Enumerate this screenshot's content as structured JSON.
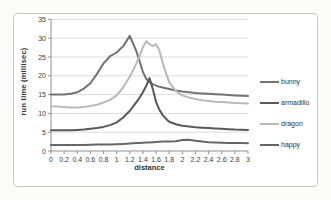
{
  "chart_data": {
    "type": "line",
    "title": "",
    "xlabel": "distance",
    "ylabel": "run time (millisec)",
    "xlim": [
      0,
      3
    ],
    "ylim": [
      0,
      35
    ],
    "grid": "horizontal",
    "legend_position": "right",
    "y_ticks": [
      0,
      5,
      10,
      15,
      20,
      25,
      30,
      35
    ],
    "y_tick_labels": [
      "0",
      "5",
      "10",
      "15",
      "20",
      "25",
      "30",
      "35"
    ],
    "x_ticks": [
      0,
      0.2,
      0.4,
      0.6,
      0.8,
      1,
      1.2,
      1.4,
      1.6,
      1.8,
      2,
      2.2,
      2.4,
      2.6,
      2.8,
      3
    ],
    "x_tick_labels": [
      "0",
      "0.2",
      "0.4",
      "0.6",
      "0.8",
      "1",
      "1.2",
      "1.4",
      "1.6",
      "1.8",
      "2",
      "2.2",
      "2.4",
      "2.6",
      "2.8",
      "3"
    ],
    "x": [
      0,
      0.1,
      0.2,
      0.3,
      0.4,
      0.5,
      0.6,
      0.7,
      0.8,
      0.9,
      1,
      1.1,
      1.2,
      1.3,
      1.35,
      1.4,
      1.45,
      1.5,
      1.55,
      1.6,
      1.65,
      1.7,
      1.75,
      1.8,
      1.9,
      2,
      2.1,
      2.2,
      2.3,
      2.4,
      2.5,
      2.6,
      2.7,
      2.8,
      2.9,
      3
    ],
    "series": [
      {
        "name": "bunny",
        "color": "#737373",
        "values": [
          15,
          15,
          15,
          15.2,
          15.6,
          16.6,
          18,
          20.5,
          23.3,
          25.2,
          26.2,
          27.9,
          30.6,
          26.5,
          23.8,
          21,
          19.2,
          18.3,
          17.8,
          17.4,
          17.1,
          16.9,
          16.7,
          16.5,
          16.1,
          15.8,
          15.6,
          15.4,
          15.3,
          15.2,
          15.1,
          15,
          14.9,
          14.8,
          14.7,
          14.6
        ]
      },
      {
        "name": "armadillo",
        "color": "#595959",
        "values": [
          5.5,
          5.5,
          5.5,
          5.5,
          5.6,
          5.7,
          5.9,
          6.1,
          6.4,
          6.9,
          7.6,
          8.9,
          10.7,
          13,
          14.2,
          15.6,
          17.3,
          19.4,
          16.5,
          13,
          11,
          9.6,
          8.6,
          7.8,
          7.1,
          6.7,
          6.5,
          6.3,
          6.2,
          6.1,
          6,
          5.9,
          5.8,
          5.7,
          5.65,
          5.6
        ]
      },
      {
        "name": "dragon",
        "color": "#b9b9b9",
        "values": [
          11.9,
          11.8,
          11.7,
          11.6,
          11.6,
          11.7,
          12,
          12.3,
          12.9,
          13.6,
          14.8,
          16.9,
          19.8,
          23.3,
          25.4,
          27.6,
          29.2,
          28.4,
          27.9,
          28.4,
          26.8,
          23.5,
          20.8,
          18.3,
          15.9,
          14.8,
          14.2,
          13.8,
          13.5,
          13.3,
          13.1,
          13,
          12.9,
          12.8,
          12.7,
          12.6
        ]
      },
      {
        "name": "happy",
        "color": "#666666",
        "values": [
          1.6,
          1.6,
          1.6,
          1.6,
          1.6,
          1.6,
          1.65,
          1.7,
          1.7,
          1.75,
          1.8,
          1.9,
          2,
          2.1,
          2.15,
          2.2,
          2.25,
          2.3,
          2.35,
          2.4,
          2.45,
          2.5,
          2.5,
          2.55,
          2.6,
          2.9,
          3,
          2.7,
          2.5,
          2.35,
          2.25,
          2.2,
          2.15,
          2.1,
          2.1,
          2.05
        ]
      }
    ],
    "colors": {
      "gridline": "#dcdcdc",
      "axis": "#919191",
      "tick_text": "#404040",
      "frame_border": "#c9c9c9"
    }
  }
}
